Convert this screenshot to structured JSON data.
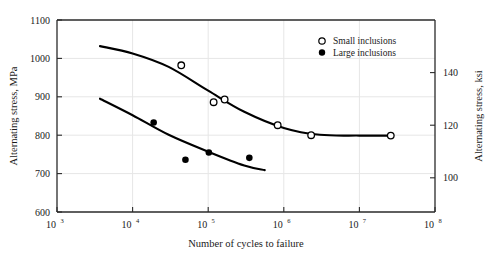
{
  "chart_data": {
    "type": "scatter",
    "title": "",
    "xlabel": "Number of cycles to failure",
    "ylabel": "Alternating stress, MPa",
    "ylabel_right": "Alternating stress, ksi",
    "xscale": "log",
    "xlim": [
      1000,
      100000000
    ],
    "ylim": [
      600,
      1100
    ],
    "ylim_right": [
      87,
      160
    ],
    "grid": true,
    "legend_position": "top-right",
    "xticks": [
      {
        "value": 1000,
        "label": "10",
        "exp": "3"
      },
      {
        "value": 10000,
        "label": "10",
        "exp": "4"
      },
      {
        "value": 100000,
        "label": "10",
        "exp": "5"
      },
      {
        "value": 1000000,
        "label": "10",
        "exp": "6"
      },
      {
        "value": 10000000,
        "label": "10",
        "exp": "7"
      },
      {
        "value": 100000000,
        "label": "10",
        "exp": "8"
      }
    ],
    "yticks_left": [
      600,
      700,
      800,
      900,
      1000,
      1100
    ],
    "yticks_right": [
      100,
      120,
      140
    ],
    "series": [
      {
        "name": "Small inclusions",
        "marker": "open-circle",
        "color": "#000000",
        "points": [
          {
            "x": 44000,
            "y": 982
          },
          {
            "x": 118000,
            "y": 886
          },
          {
            "x": 165000,
            "y": 893
          },
          {
            "x": 830000,
            "y": 826
          },
          {
            "x": 2300000,
            "y": 800
          },
          {
            "x": 26000000,
            "y": 799
          }
        ],
        "fit_curve": [
          {
            "x": 3700,
            "y": 1032
          },
          {
            "x": 10000,
            "y": 1013
          },
          {
            "x": 30000,
            "y": 978
          },
          {
            "x": 100000,
            "y": 916
          },
          {
            "x": 300000,
            "y": 861
          },
          {
            "x": 1000000,
            "y": 819
          },
          {
            "x": 3000000,
            "y": 801
          },
          {
            "x": 10000000,
            "y": 799
          },
          {
            "x": 27000000,
            "y": 799
          }
        ]
      },
      {
        "name": "Large inclusions",
        "marker": "filled-circle",
        "color": "#000000",
        "points": [
          {
            "x": 19000,
            "y": 833
          },
          {
            "x": 50000,
            "y": 736
          },
          {
            "x": 102000,
            "y": 755
          },
          {
            "x": 350000,
            "y": 741
          }
        ],
        "fit_curve": [
          {
            "x": 3700,
            "y": 895
          },
          {
            "x": 10000,
            "y": 852
          },
          {
            "x": 30000,
            "y": 801
          },
          {
            "x": 100000,
            "y": 757
          },
          {
            "x": 300000,
            "y": 721
          },
          {
            "x": 560000,
            "y": 709
          }
        ]
      }
    ]
  },
  "legend": {
    "entries": [
      {
        "label": "Small inclusions",
        "marker": "open-circle"
      },
      {
        "label": "Large inclusions",
        "marker": "filled-circle"
      }
    ]
  },
  "axes": {
    "left_title": "Alternating stress, MPa",
    "right_title": "Alternating stress, ksi",
    "bottom_title": "Number of cycles to failure"
  },
  "colors": {
    "axis": "#2a2a2a",
    "grid": "#e6e6e6",
    "curve": "#000000",
    "text": "#1a1a1a",
    "background": "#ffffff"
  }
}
